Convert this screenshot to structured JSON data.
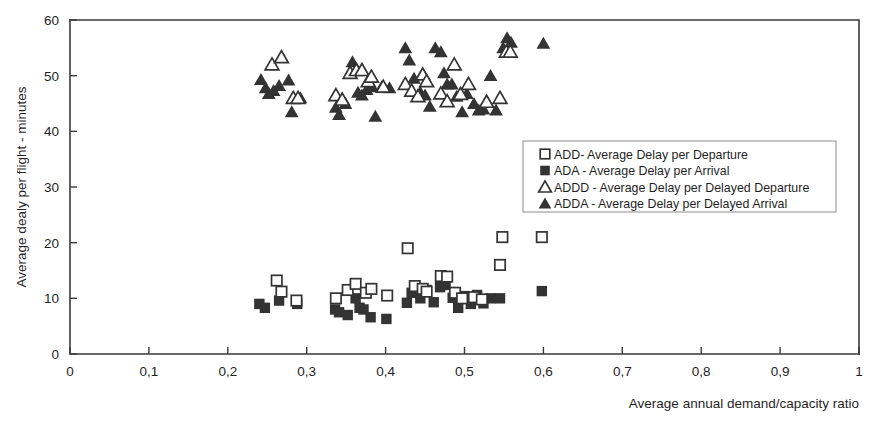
{
  "chart_data": {
    "type": "scatter",
    "title": "",
    "xlabel": "Average annual demand/capacity ratio",
    "ylabel": "Average dealy per flight - minutes",
    "xlim": [
      0,
      1
    ],
    "ylim": [
      0,
      60
    ],
    "grid": false,
    "legend_position": "center-right",
    "xticks": [
      "0",
      "0,1",
      "0,2",
      "0,3",
      "0,4",
      "0,5",
      "0,6",
      "0,7",
      "0,8",
      "0,9",
      "1"
    ],
    "xtick_values": [
      0,
      0.1,
      0.2,
      0.3,
      0.4,
      0.5,
      0.6,
      0.7,
      0.8,
      0.9,
      1
    ],
    "yticks": [
      "0",
      "10",
      "20",
      "30",
      "40",
      "50",
      "60"
    ],
    "ytick_values": [
      0,
      10,
      20,
      30,
      40,
      50,
      60
    ],
    "series": [
      {
        "name": "ADD- Average Delay per Departure",
        "key": "ADD",
        "marker": "open-square",
        "color": "#333333",
        "points": [
          [
            0.262,
            13.2
          ],
          [
            0.268,
            11.2
          ],
          [
            0.337,
            10.0
          ],
          [
            0.352,
            11.5
          ],
          [
            0.362,
            12.6
          ],
          [
            0.375,
            11.0
          ],
          [
            0.382,
            11.7
          ],
          [
            0.402,
            10.5
          ],
          [
            0.428,
            19.0
          ],
          [
            0.437,
            12.2
          ],
          [
            0.447,
            11.7
          ],
          [
            0.452,
            11.2
          ],
          [
            0.47,
            14.0
          ],
          [
            0.478,
            13.9
          ],
          [
            0.488,
            11.0
          ],
          [
            0.497,
            10.0
          ],
          [
            0.512,
            10.2
          ],
          [
            0.522,
            9.8
          ],
          [
            0.545,
            16.0
          ],
          [
            0.548,
            21.0
          ],
          [
            0.598,
            21.0
          ],
          [
            0.287,
            9.6
          ]
        ]
      },
      {
        "name": "ADA - Average Delay per Arrival",
        "key": "ADA",
        "marker": "filled-square",
        "color": "#333333",
        "points": [
          [
            0.24,
            9.0
          ],
          [
            0.247,
            8.3
          ],
          [
            0.265,
            9.6
          ],
          [
            0.288,
            9.0
          ],
          [
            0.336,
            8.0
          ],
          [
            0.341,
            7.5
          ],
          [
            0.352,
            7.0
          ],
          [
            0.362,
            10.0
          ],
          [
            0.367,
            8.3
          ],
          [
            0.372,
            8.0
          ],
          [
            0.381,
            6.6
          ],
          [
            0.401,
            6.3
          ],
          [
            0.427,
            9.2
          ],
          [
            0.433,
            11.0
          ],
          [
            0.444,
            10.0
          ],
          [
            0.452,
            11.5
          ],
          [
            0.461,
            9.3
          ],
          [
            0.469,
            12.0
          ],
          [
            0.476,
            12.4
          ],
          [
            0.485,
            10.1
          ],
          [
            0.492,
            8.3
          ],
          [
            0.5,
            10.4
          ],
          [
            0.508,
            9.0
          ],
          [
            0.516,
            10.6
          ],
          [
            0.524,
            9.1
          ],
          [
            0.533,
            10.0
          ],
          [
            0.545,
            10.0
          ],
          [
            0.598,
            11.3
          ]
        ]
      },
      {
        "name": "ADDD - Average Delay per Delayed Departure",
        "key": "ADDD",
        "marker": "open-triangle",
        "color": "#333333",
        "points": [
          [
            0.256,
            52.0
          ],
          [
            0.268,
            53.3
          ],
          [
            0.283,
            46.0
          ],
          [
            0.289,
            46.0
          ],
          [
            0.337,
            46.5
          ],
          [
            0.345,
            45.7
          ],
          [
            0.355,
            50.5
          ],
          [
            0.363,
            51.0
          ],
          [
            0.37,
            51.0
          ],
          [
            0.378,
            49.0
          ],
          [
            0.382,
            49.8
          ],
          [
            0.397,
            48.0
          ],
          [
            0.425,
            48.5
          ],
          [
            0.433,
            47.3
          ],
          [
            0.441,
            46.3
          ],
          [
            0.447,
            50.2
          ],
          [
            0.452,
            49.0
          ],
          [
            0.47,
            46.8
          ],
          [
            0.478,
            45.4
          ],
          [
            0.487,
            52.0
          ],
          [
            0.495,
            46.7
          ],
          [
            0.505,
            48.5
          ],
          [
            0.528,
            45.3
          ],
          [
            0.545,
            46.0
          ],
          [
            0.553,
            54.3
          ],
          [
            0.558,
            54.3
          ]
        ]
      },
      {
        "name": "ADDA - Average Delay per Delayed Arrival",
        "key": "ADDA",
        "marker": "filled-triangle",
        "color": "#333333",
        "points": [
          [
            0.242,
            49.3
          ],
          [
            0.248,
            47.8
          ],
          [
            0.252,
            46.8
          ],
          [
            0.258,
            47.3
          ],
          [
            0.265,
            48.2
          ],
          [
            0.277,
            49.2
          ],
          [
            0.281,
            43.5
          ],
          [
            0.292,
            46.0
          ],
          [
            0.337,
            44.3
          ],
          [
            0.341,
            43.0
          ],
          [
            0.349,
            45.0
          ],
          [
            0.358,
            52.5
          ],
          [
            0.365,
            47.0
          ],
          [
            0.37,
            46.5
          ],
          [
            0.376,
            47.5
          ],
          [
            0.383,
            48.0
          ],
          [
            0.387,
            42.7
          ],
          [
            0.395,
            48.0
          ],
          [
            0.405,
            47.8
          ],
          [
            0.425,
            55.0
          ],
          [
            0.43,
            52.8
          ],
          [
            0.436,
            49.5
          ],
          [
            0.444,
            47.0
          ],
          [
            0.45,
            46.5
          ],
          [
            0.456,
            44.5
          ],
          [
            0.463,
            55.0
          ],
          [
            0.47,
            54.3
          ],
          [
            0.474,
            50.5
          ],
          [
            0.478,
            48.5
          ],
          [
            0.484,
            48.5
          ],
          [
            0.49,
            46.3
          ],
          [
            0.497,
            43.5
          ],
          [
            0.503,
            46.8
          ],
          [
            0.512,
            45.0
          ],
          [
            0.518,
            43.8
          ],
          [
            0.524,
            44.0
          ],
          [
            0.533,
            50.0
          ],
          [
            0.54,
            43.8
          ],
          [
            0.549,
            55.0
          ],
          [
            0.554,
            56.8
          ],
          [
            0.559,
            56.0
          ],
          [
            0.6,
            55.8
          ]
        ]
      }
    ]
  },
  "legend": {
    "items": [
      {
        "marker": "open-square",
        "label": "ADD- Average Delay per Departure"
      },
      {
        "marker": "filled-square",
        "label": "ADA - Average Delay per Arrival"
      },
      {
        "marker": "open-triangle",
        "label": "ADDD - Average Delay per Delayed Departure"
      },
      {
        "marker": "filled-triangle",
        "label": "ADDA - Average Delay per Delayed Arrival"
      }
    ]
  },
  "colors": {
    "marker": "#333333",
    "axis": "#3a3a3a",
    "text": "#1f1f1f",
    "legend_border": "#8d8d8d",
    "background": "#ffffff"
  }
}
